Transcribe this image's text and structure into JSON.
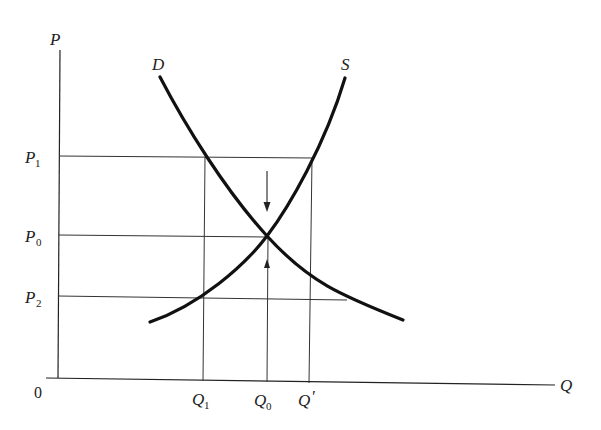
{
  "diagram": {
    "type": "supply-demand",
    "axes": {
      "y_label": "P",
      "x_label": "Q",
      "origin_label": "0"
    },
    "curves": {
      "demand": {
        "label": "D"
      },
      "supply": {
        "label": "S"
      }
    },
    "price_levels": [
      {
        "base": "P",
        "sub": "1"
      },
      {
        "base": "P",
        "sub": "0"
      },
      {
        "base": "P",
        "sub": "2"
      }
    ],
    "quantity_levels": [
      {
        "base": "Q",
        "sub": "1"
      },
      {
        "base": "Q",
        "sub": "0"
      },
      {
        "base": "Q",
        "sub": "'"
      }
    ],
    "annotations": [
      {
        "name": "down-arrow-toward-equilibrium",
        "direction": "down"
      },
      {
        "name": "up-arrow-toward-equilibrium",
        "direction": "up"
      }
    ],
    "colors": {
      "ink": "#222222",
      "background": "#ffffff"
    }
  }
}
